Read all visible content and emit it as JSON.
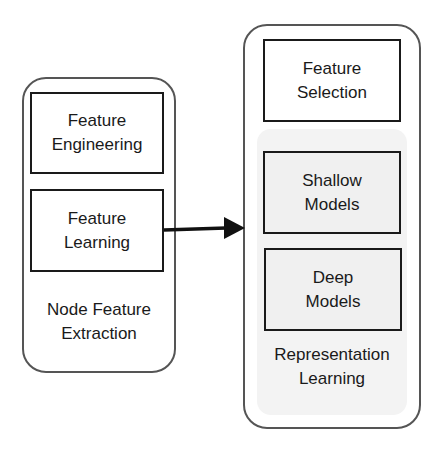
{
  "diagram": {
    "left_group": {
      "label": "Node Feature\nExtraction",
      "boxes": [
        {
          "label": "Feature\nEngineering"
        },
        {
          "label": "Feature\nLearning"
        }
      ]
    },
    "right_group": {
      "top_box": {
        "label": "Feature\nSelection"
      },
      "subgroup": {
        "label": "Representation\nLearning",
        "boxes": [
          {
            "label": "Shallow\nModels"
          },
          {
            "label": "Deep\nModels"
          }
        ]
      }
    },
    "edges": [
      {
        "from": "Feature Learning",
        "to": "Representation Learning group",
        "type": "arrow"
      }
    ],
    "colors": {
      "outline": "#555555",
      "box_border": "#1a1a1a",
      "subgroup_fill": "#f3f3f3"
    }
  }
}
